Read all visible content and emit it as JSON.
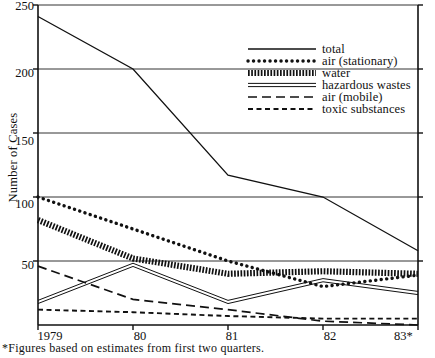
{
  "chart_data": {
    "type": "line",
    "title": "",
    "subtitle": "",
    "xlabel": "",
    "ylabel": "Number of Cases",
    "x": [
      "1979",
      "80",
      "81",
      "82",
      "83*"
    ],
    "x_tick_labels": [
      "1979",
      "80",
      "81",
      "82",
      "83*"
    ],
    "y_tick_labels": [
      "250",
      "200",
      "150",
      "100",
      "50"
    ],
    "y_ticks": [
      250,
      200,
      150,
      100,
      50
    ],
    "ylim": [
      0,
      250
    ],
    "grid": "horizontal",
    "legend_position": "upper-right",
    "footnote": "*Figures based on estimates from first two quarters.",
    "series": [
      {
        "name": "total",
        "style": "solid",
        "values": [
          241,
          200,
          117,
          100,
          58
        ]
      },
      {
        "name": "air (stationary)",
        "style": "dotted",
        "values": [
          100,
          75,
          50,
          30,
          39
        ]
      },
      {
        "name": "water",
        "style": "hatch",
        "values": [
          82,
          52,
          40,
          42,
          40
        ]
      },
      {
        "name": "hazardous wastes",
        "style": "double",
        "values": [
          18,
          47,
          18,
          35,
          25
        ]
      },
      {
        "name": "air (mobile)",
        "style": "long-dash",
        "values": [
          46,
          20,
          12,
          3,
          0
        ]
      },
      {
        "name": "toxic substances",
        "style": "short-dash",
        "values": [
          12,
          10,
          7,
          5,
          5
        ]
      }
    ]
  },
  "legend": {
    "items": [
      {
        "label": "total"
      },
      {
        "label": "air (stationary)"
      },
      {
        "label": "water"
      },
      {
        "label": "hazardous wastes"
      },
      {
        "label": "air (mobile)"
      },
      {
        "label": "toxic substances"
      }
    ]
  },
  "colors": {
    "ink": "#111111",
    "background": "#ffffff",
    "axis": "#1a1a1a",
    "grid": "#333333"
  }
}
